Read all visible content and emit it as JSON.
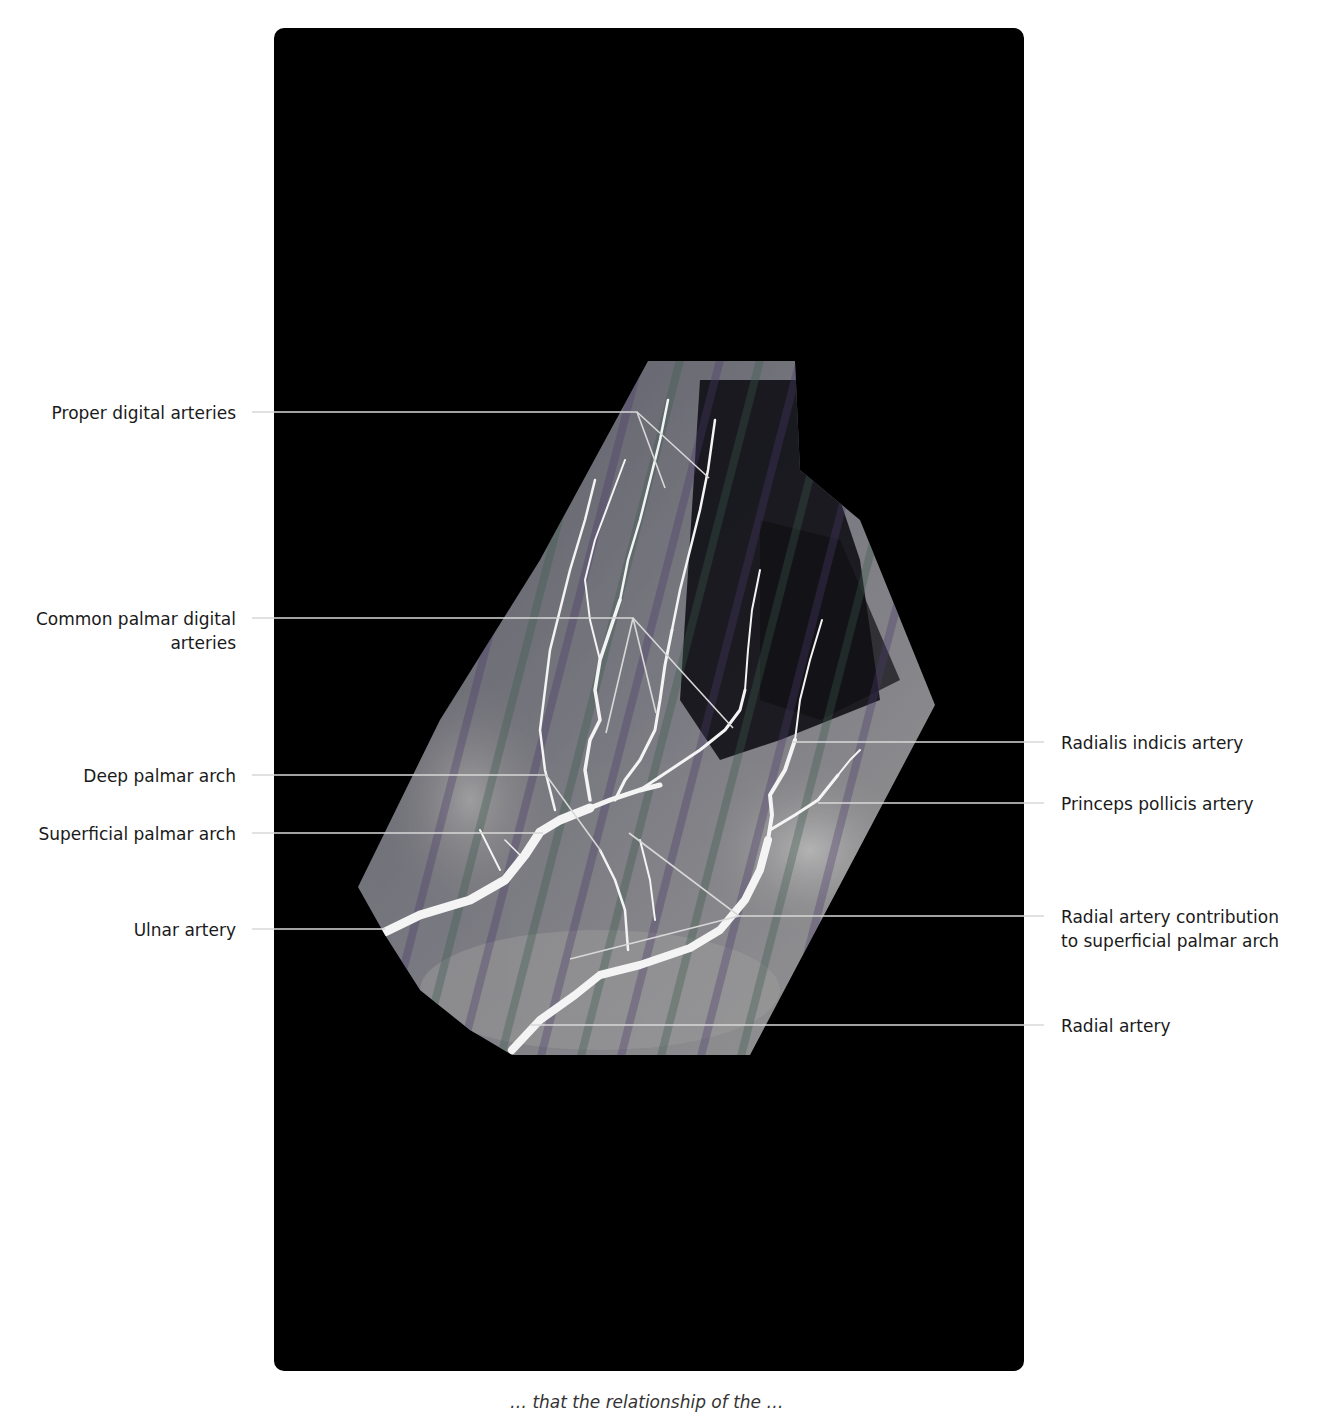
{
  "figure": {
    "type": "hand angiogram with anatomical labels",
    "labels_left": [
      {
        "id": "proper-digital",
        "text": "Proper digital arteries",
        "lines": [
          "Proper digital arteries"
        ],
        "y": 412
      },
      {
        "id": "common-palmar-digital",
        "text": "Common palmar digital arteries",
        "lines": [
          "Common palmar digital",
          "arteries"
        ],
        "y": 618
      },
      {
        "id": "deep-palmar-arch",
        "text": "Deep palmar arch",
        "lines": [
          "Deep palmar arch"
        ],
        "y": 775
      },
      {
        "id": "superficial-palmar-arch",
        "text": "Superficial palmar arch",
        "lines": [
          "Superficial palmar arch"
        ],
        "y": 833
      },
      {
        "id": "ulnar-artery",
        "text": "Ulnar artery",
        "lines": [
          "Ulnar artery"
        ],
        "y": 929
      }
    ],
    "labels_right": [
      {
        "id": "radialis-indicis",
        "text": "Radialis indicis artery",
        "lines": [
          "Radialis indicis artery"
        ],
        "y": 742
      },
      {
        "id": "princeps-pollicis",
        "text": "Princeps pollicis artery",
        "lines": [
          "Princeps pollicis artery"
        ],
        "y": 803
      },
      {
        "id": "radial-contribution",
        "text": "Radial artery contribution to superficial palmar arch",
        "lines": [
          "Radial artery contribution",
          "to superficial palmar arch"
        ],
        "y": 916
      },
      {
        "id": "radial-artery",
        "text": "Radial artery",
        "lines": [
          "Radial artery"
        ],
        "y": 1025
      }
    ],
    "caption_partial": "… that the relationship of the …"
  },
  "colors": {
    "panel": "#000000",
    "leader": "#d8d8d8",
    "vessel": "#f4f4f4",
    "tissue": "#8a8a8a",
    "text": "#1a1a1a"
  }
}
